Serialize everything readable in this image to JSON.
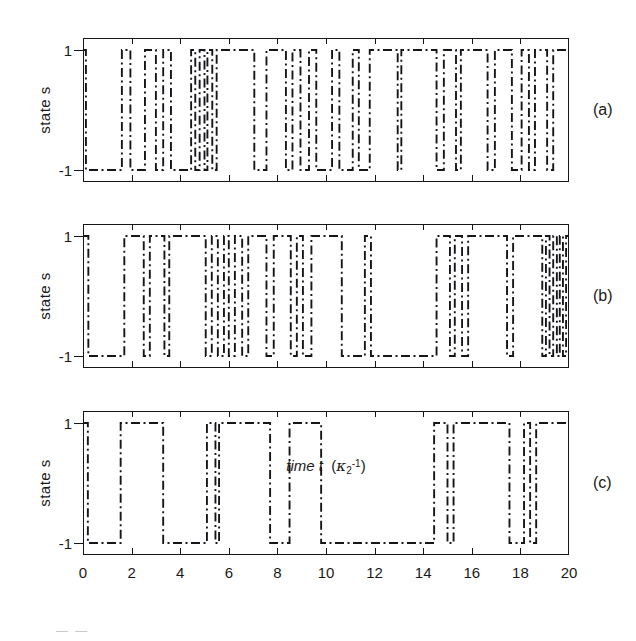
{
  "figure": {
    "y_axis_label": "state s",
    "x_axis_label_main": "time t",
    "x_axis_unit_base": "κ",
    "x_axis_unit_sub": "2",
    "x_axis_unit_sup": "-1",
    "y_tick_top": "1",
    "y_tick_bottom": "-1",
    "x_ticks": [
      "0",
      "2",
      "4",
      "6",
      "8",
      "10",
      "12",
      "14",
      "16",
      "18",
      "20"
    ],
    "panels": [
      {
        "id": "a",
        "letter": "(a)"
      },
      {
        "id": "b",
        "letter": "(b)"
      },
      {
        "id": "c",
        "letter": "(c)"
      }
    ],
    "caption_fragment": "—   —"
  },
  "chart_data": [
    {
      "type": "line",
      "id": "panel-a",
      "title": "(a)",
      "xlabel": "time t (κ₂⁻¹)",
      "ylabel": "state s",
      "xlim": [
        0,
        20
      ],
      "ylim": [
        -1,
        1
      ],
      "y_levels": [
        -1,
        1
      ],
      "grid": false,
      "legend": "none",
      "description": "Dichotomous telegraph signal switching between s = +1 and s = -1; fastest/most irregular switching of the three panels.",
      "step_x": [
        0.0,
        0.12,
        1.6,
        1.95,
        2.55,
        3.0,
        3.3,
        3.62,
        4.45,
        4.62,
        4.8,
        5.0,
        5.12,
        5.32,
        5.5,
        7.05,
        7.55,
        8.35,
        8.62,
        8.95,
        9.3,
        9.6,
        10.25,
        10.55,
        11.1,
        11.35,
        11.8,
        12.95,
        13.1,
        14.55,
        14.85,
        15.35,
        15.55,
        16.65,
        16.95,
        17.65,
        18.05,
        18.35,
        18.6,
        19.1,
        19.35,
        20.0
      ],
      "step_y": [
        1,
        -1,
        1,
        -1,
        1,
        -1,
        1,
        -1,
        1,
        -1,
        1,
        -1,
        1,
        -1,
        1,
        -1,
        1,
        -1,
        1,
        -1,
        1,
        -1,
        1,
        -1,
        1,
        -1,
        1,
        -1,
        1,
        -1,
        1,
        -1,
        1,
        -1,
        1,
        -1,
        1,
        -1,
        1,
        -1,
        1,
        1
      ]
    },
    {
      "type": "line",
      "id": "panel-b",
      "title": "(b)",
      "xlabel": "time t (κ₂⁻¹)",
      "ylabel": "state s",
      "xlim": [
        0,
        20
      ],
      "ylim": [
        -1,
        1
      ],
      "y_levels": [
        -1,
        1
      ],
      "grid": false,
      "legend": "none",
      "description": "Dichotomous telegraph signal with intermediate switching rate; includes a very dense burst of switching near t = 19-20.",
      "step_x": [
        0.0,
        0.22,
        1.7,
        2.5,
        2.75,
        3.35,
        3.55,
        5.05,
        5.3,
        5.55,
        5.8,
        6.0,
        6.25,
        6.55,
        6.8,
        7.55,
        7.85,
        8.55,
        8.8,
        9.05,
        9.4,
        10.65,
        11.6,
        11.85,
        14.55,
        15.1,
        15.3,
        15.6,
        15.85,
        17.45,
        17.7,
        18.9,
        19.05,
        19.2,
        19.35,
        19.5,
        19.62,
        19.75,
        19.88,
        20.0
      ],
      "step_y": [
        1,
        -1,
        1,
        -1,
        1,
        -1,
        1,
        -1,
        1,
        -1,
        1,
        -1,
        1,
        -1,
        1,
        -1,
        1,
        -1,
        1,
        -1,
        1,
        -1,
        1,
        -1,
        1,
        -1,
        1,
        -1,
        1,
        -1,
        1,
        -1,
        1,
        -1,
        1,
        -1,
        1,
        -1,
        1,
        1
      ]
    },
    {
      "type": "line",
      "id": "panel-c",
      "title": "(c)",
      "xlabel": "time t (κ₂⁻¹)",
      "ylabel": "state s",
      "xlim": [
        0,
        20
      ],
      "ylim": [
        -1,
        1
      ],
      "y_levels": [
        -1,
        1
      ],
      "grid": false,
      "legend": "none",
      "description": "Dichotomous telegraph signal with the slowest switching rate; broad plateaus with a short burst near t = 18.5.",
      "step_x": [
        0.0,
        0.2,
        1.55,
        3.3,
        5.1,
        5.45,
        5.6,
        7.7,
        8.5,
        9.8,
        14.45,
        15.0,
        15.25,
        17.55,
        18.15,
        18.4,
        18.65,
        18.85,
        20.0
      ],
      "step_y": [
        1,
        -1,
        1,
        -1,
        1,
        -1,
        1,
        -1,
        1,
        -1,
        1,
        -1,
        1,
        -1,
        1,
        -1,
        1,
        1,
        1
      ]
    }
  ]
}
